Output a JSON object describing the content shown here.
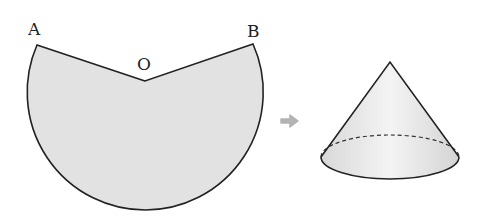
{
  "figure": {
    "sector": {
      "labels": {
        "a": "A",
        "b": "B",
        "o": "O"
      },
      "fill": "#e4e4e4",
      "stroke": "#222222"
    },
    "arrow": {
      "icon": "right-arrow-icon",
      "color": "#b3b3b3"
    },
    "cone": {
      "fill": "#ececec",
      "stroke": "#222222",
      "hidden_edge": "dashed"
    }
  }
}
